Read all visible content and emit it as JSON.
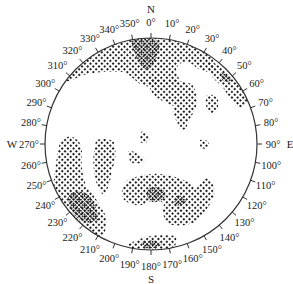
{
  "diagram": {
    "type": "stereonet-density-plot",
    "center": [
      151,
      144
    ],
    "radius": 106,
    "colors": {
      "ink": "#222222",
      "background": "#ffffff"
    },
    "cardinals": [
      {
        "label": "N",
        "angle": 0
      },
      {
        "label": "E",
        "angle": 90
      },
      {
        "label": "S",
        "angle": 180
      },
      {
        "label": "W",
        "angle": 270
      }
    ],
    "tick_labels": [
      "0°",
      "10°",
      "20°",
      "30°",
      "40°",
      "50°",
      "60°",
      "70°",
      "80°",
      "90°",
      "100°",
      "110°",
      "120°",
      "130°",
      "140°",
      "150°",
      "160°",
      "170°",
      "180°",
      "190°",
      "200°",
      "210°",
      "220°",
      "230°",
      "240°",
      "250°",
      "260°",
      "270°",
      "280°",
      "290°",
      "300°",
      "310°",
      "320°",
      "330°",
      "340°",
      "350°"
    ],
    "density_levels": [
      {
        "name": "low",
        "style": "sparse-stipple"
      },
      {
        "name": "high",
        "style": "dense-stipple"
      }
    ],
    "concentrations": [
      {
        "name": "north-maximum",
        "approx_azimuth": 350,
        "level": "high"
      },
      {
        "name": "southwest-maximum",
        "approx_azimuth": 235,
        "level": "high"
      },
      {
        "name": "south-central-maximum",
        "approx_azimuth": 165,
        "level": "high"
      },
      {
        "name": "northeast-rim-band",
        "approx_azimuth": 45,
        "level": "low"
      }
    ]
  }
}
